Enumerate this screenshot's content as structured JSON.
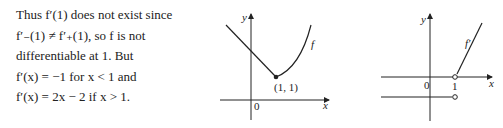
{
  "paragraph": {
    "lines": [
      "Thus f′(1) does not exist since",
      "f′₋(1) ≠ f′₊(1), so f is not",
      "differentiable at 1.  But",
      "f′(x) = −1 for x < 1 and",
      "f′(x) = 2x − 2 if x > 1."
    ]
  },
  "graph_f": {
    "y_axis_label": "y",
    "x_axis_label": "x",
    "origin_label": "0",
    "point_label": "(1, 1)",
    "curve_label": "f"
  },
  "graph_fprime": {
    "y_axis_label": "y",
    "x_axis_label": "x",
    "origin_label": "0",
    "tick_label": "1",
    "curve_label": "f′"
  }
}
